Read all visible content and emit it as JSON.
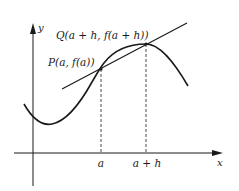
{
  "diagram": {
    "axes": {
      "x_label": "x",
      "y_label": "y"
    },
    "points": {
      "P": {
        "label": "P(a, f(a))"
      },
      "Q": {
        "label": "Q(a + h, f(a + h))"
      }
    },
    "ticks": {
      "a": "a",
      "a_plus_h": "a + h"
    },
    "elements": [
      "curve y = f(x)",
      "secant line PQ",
      "dashed vertical from P to x-axis",
      "dashed vertical from Q to x-axis"
    ],
    "colors": {
      "ink": "#1a1a1a",
      "background": "#ffffff"
    }
  }
}
